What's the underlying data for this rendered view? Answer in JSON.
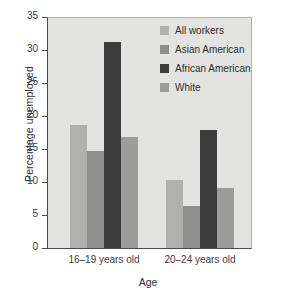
{
  "chart_data": {
    "type": "bar",
    "title": "",
    "xlabel": "Age",
    "ylabel": "Percentage unemployed",
    "categories": [
      "16–19 years old",
      "20–24 years old"
    ],
    "series": [
      {
        "name": "All workers",
        "color": "#b0b0ae",
        "values": [
          18.7,
          10.3
        ]
      },
      {
        "name": "Asian American",
        "color": "#8e8e8c",
        "values": [
          14.7,
          6.4
        ]
      },
      {
        "name": "African American",
        "color": "#3c3c3c",
        "values": [
          31.3,
          18.0
        ]
      },
      {
        "name": "White",
        "color": "#9c9c9a",
        "values": [
          16.9,
          9.2
        ]
      }
    ],
    "ylim": [
      0,
      35
    ],
    "yticks": [
      0,
      5,
      10,
      15,
      20,
      25,
      30,
      35
    ],
    "ytick_labels": [
      "0",
      "5",
      "10",
      "15",
      "20",
      "25",
      "30",
      "35"
    ],
    "grid": false,
    "legend_position": "top-right",
    "plot_background": "#e3e3e1",
    "axis_color": "#4a4a4a"
  },
  "legend": {
    "items": [
      {
        "label": "All workers"
      },
      {
        "label": "Asian American"
      },
      {
        "label": "African American"
      },
      {
        "label": "White"
      }
    ]
  }
}
